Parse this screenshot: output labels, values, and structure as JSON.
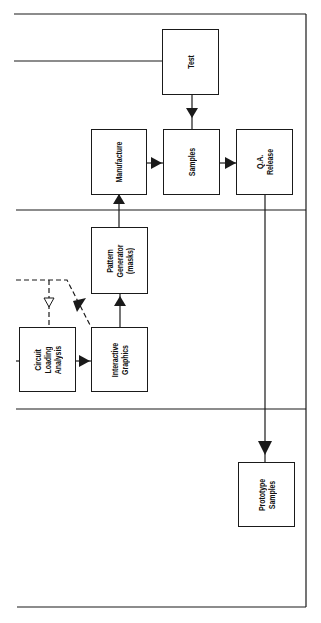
{
  "diagram": {
    "orientation": "rotated-90",
    "colors": {
      "line": "#1a1a1a",
      "background": "#ffffff"
    },
    "boxes": {
      "test": {
        "lines": [
          "Test"
        ]
      },
      "manufacture": {
        "lines": [
          "Manufacture"
        ]
      },
      "samples": {
        "lines": [
          "Samples"
        ]
      },
      "qa_release": {
        "lines": [
          "Q.A.",
          "Release"
        ]
      },
      "pattern_generator": {
        "lines": [
          "Pattern",
          "Generator",
          "(masks)"
        ]
      },
      "circuit_loading_analysis": {
        "lines": [
          "Circuit",
          "Loading",
          "Analysis"
        ]
      },
      "interactive_graphics": {
        "lines": [
          "Interactive",
          "Graphics"
        ]
      },
      "prototype_samples": {
        "lines": [
          "Prototype",
          "Samples"
        ]
      }
    },
    "connections": [
      {
        "from": "Test",
        "to": "Samples",
        "style": "solid",
        "arrow": "filled"
      },
      {
        "from": "Manufacture",
        "to": "Samples",
        "style": "solid",
        "arrow": "filled"
      },
      {
        "from": "Samples",
        "to": "Q.A. Release",
        "style": "solid",
        "arrow": "filled"
      },
      {
        "from": "Pattern Generator (masks)",
        "to": "Manufacture",
        "style": "solid",
        "arrow": "filled"
      },
      {
        "from": "Interactive Graphics",
        "to": "Pattern Generator (masks)",
        "style": "solid",
        "arrow": "filled"
      },
      {
        "from": "Circuit Loading Analysis",
        "to": "Interactive Graphics",
        "style": "solid",
        "arrow": "filled"
      },
      {
        "from": "Q.A. Release",
        "to": "Prototype Samples",
        "style": "solid",
        "arrow": "filled"
      },
      {
        "from": "Interactive Graphics",
        "to": "external (left)",
        "style": "dashed",
        "arrow": "filled"
      },
      {
        "from": "external (left)",
        "to": "Circuit Loading Analysis",
        "style": "dashed",
        "arrow": "hollow"
      }
    ]
  }
}
